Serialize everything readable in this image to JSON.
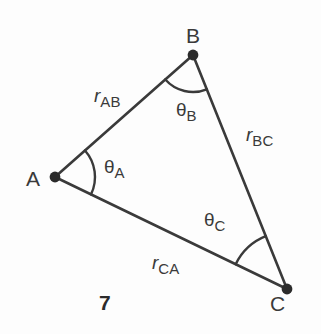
{
  "figure": {
    "number": "7",
    "stroke_color": "#3a3a3a",
    "background_color": "#fdfdfd",
    "vertices": [
      {
        "id": "A",
        "label": "A",
        "x": 55,
        "y": 177,
        "label_x": 26,
        "label_y": 168
      },
      {
        "id": "B",
        "label": "B",
        "x": 193,
        "y": 55,
        "label_x": 186,
        "label_y": 25
      },
      {
        "id": "C",
        "label": "C",
        "x": 287,
        "y": 289,
        "label_x": 270,
        "label_y": 293
      }
    ],
    "sides": [
      {
        "id": "AB",
        "base": "r",
        "sub": "AB",
        "from": "A",
        "to": "B",
        "label_x": 94,
        "label_y": 86
      },
      {
        "id": "BC",
        "base": "r",
        "sub": "BC",
        "from": "B",
        "to": "C",
        "label_x": 246,
        "label_y": 125
      },
      {
        "id": "CA",
        "base": "r",
        "sub": "CA",
        "from": "C",
        "to": "A",
        "label_x": 152,
        "label_y": 253
      }
    ],
    "angles": [
      {
        "id": "A",
        "base": "θ",
        "sub": "A",
        "vertex": "A",
        "label_x": 104,
        "label_y": 157,
        "arc_radius": 40
      },
      {
        "id": "B",
        "base": "θ",
        "sub": "B",
        "vertex": "B",
        "label_x": 176,
        "label_y": 100,
        "arc_radius": 37
      },
      {
        "id": "C",
        "base": "θ",
        "sub": "C",
        "vertex": "C",
        "label_x": 204,
        "label_y": 210,
        "arc_radius": 57
      }
    ]
  }
}
